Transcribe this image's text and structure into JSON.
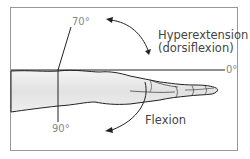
{
  "diagram": {
    "labels": {
      "angle_70": "70°",
      "angle_0": "0°",
      "angle_90": "90°",
      "hyperextension_line1": "Hyperextension",
      "hyperextension_line2": "(dorsiflexion)",
      "flexion": "Flexion"
    },
    "colors": {
      "border": "#999999",
      "line": "#222222",
      "arm_fill": "#e6e6e6",
      "label": "#444444",
      "degree_label": "#888888"
    }
  }
}
